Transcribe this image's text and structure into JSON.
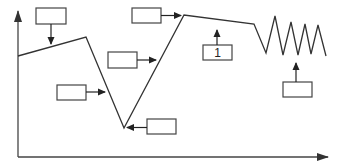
{
  "diagram": {
    "type": "line-graph-with-callouts",
    "colors": {
      "line": "#333333",
      "box_stroke": "#444444",
      "background": "#ffffff"
    },
    "axes": {
      "y_axis": {
        "x": 18,
        "y_top": 10,
        "y_bottom": 157
      },
      "x_axis": {
        "y": 157,
        "x_left": 18,
        "x_right": 328
      }
    },
    "curve_points": "18,56 86,37 124,128 184,15 254,24 266,53 275,16 283,55 291,22 298,55 305,24 311,54 318,25 326,56",
    "callouts": [
      {
        "id": "box-top-left",
        "label": "",
        "x": 36,
        "y": 8,
        "w": 30,
        "h": 16,
        "arrow_direction": "down"
      },
      {
        "id": "box-top-middle",
        "label": "",
        "x": 132,
        "y": 8,
        "w": 29,
        "h": 15,
        "arrow_direction": "right"
      },
      {
        "id": "box-middle",
        "label": "",
        "x": 108,
        "y": 52,
        "w": 29,
        "h": 16,
        "arrow_direction": "right"
      },
      {
        "id": "box-left",
        "label": "",
        "x": 57,
        "y": 85,
        "w": 29,
        "h": 15,
        "arrow_direction": "right"
      },
      {
        "id": "box-bottom",
        "label": "",
        "x": 147,
        "y": 119,
        "w": 29,
        "h": 15,
        "arrow_direction": "left"
      },
      {
        "id": "box-numbered",
        "label": "1",
        "x": 203,
        "y": 45,
        "w": 29,
        "h": 15,
        "arrow_direction": "up"
      },
      {
        "id": "box-right",
        "label": "",
        "x": 283,
        "y": 82,
        "w": 29,
        "h": 15,
        "arrow_direction": "up"
      }
    ]
  }
}
